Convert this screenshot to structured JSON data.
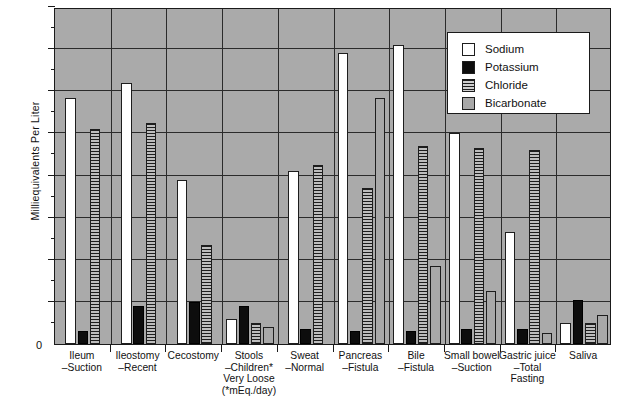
{
  "chart_data": {
    "type": "bar",
    "title": "",
    "xlabel": "",
    "ylabel": "Milliequivalents  Per  Liter",
    "ylim": [
      0,
      160
    ],
    "ytick_values": [
      0,
      20,
      40,
      60,
      80,
      100,
      120,
      140,
      160
    ],
    "ytick_labels": [
      "0",
      "20",
      "40",
      "60",
      "80",
      "100",
      "120",
      "140",
      "160"
    ],
    "grid": true,
    "legend_position": "top-right",
    "categories": [
      "Ileum\n–Suction",
      "Ileostomy\n–Recent",
      "Cecostomy",
      "Stools\n–Children*\nVery  Loose\n(*mEq./day)",
      "Sweat\n–Normal",
      "Pancreas\n–Fistula",
      "Bile\n–Fistula",
      "Small bowel\n–Suction",
      "Gastric juice\n–Total\nFasting",
      "Saliva"
    ],
    "series": [
      {
        "name": "Sodium",
        "swatch": "white",
        "color": "#ffffff",
        "values": [
          117,
          124,
          78,
          12,
          82,
          138,
          142,
          100,
          53,
          10
        ]
      },
      {
        "name": "Potassium",
        "swatch": "black",
        "color": "#0d0d0d",
        "values": [
          6,
          18,
          20,
          18,
          7,
          6,
          6,
          7,
          7,
          21
        ]
      },
      {
        "name": "Chloride",
        "swatch": "horizontal-lines",
        "color": "#1d1d1d",
        "values": [
          102,
          105,
          47,
          10,
          85,
          74,
          94,
          93,
          92,
          10
        ]
      },
      {
        "name": "Bicarbonate",
        "swatch": "gray",
        "color": "#a8a8a8",
        "values": [
          null,
          null,
          null,
          8,
          null,
          117,
          37,
          25,
          5,
          14
        ]
      }
    ]
  },
  "legend": {
    "items": [
      {
        "label": "Sodium"
      },
      {
        "label": "Potassium"
      },
      {
        "label": "Chloride"
      },
      {
        "label": "Bicarbonate"
      }
    ]
  },
  "axes": {
    "zero_label": "0",
    "y_axis_title": "Milliequivalents  Per  Liter"
  }
}
